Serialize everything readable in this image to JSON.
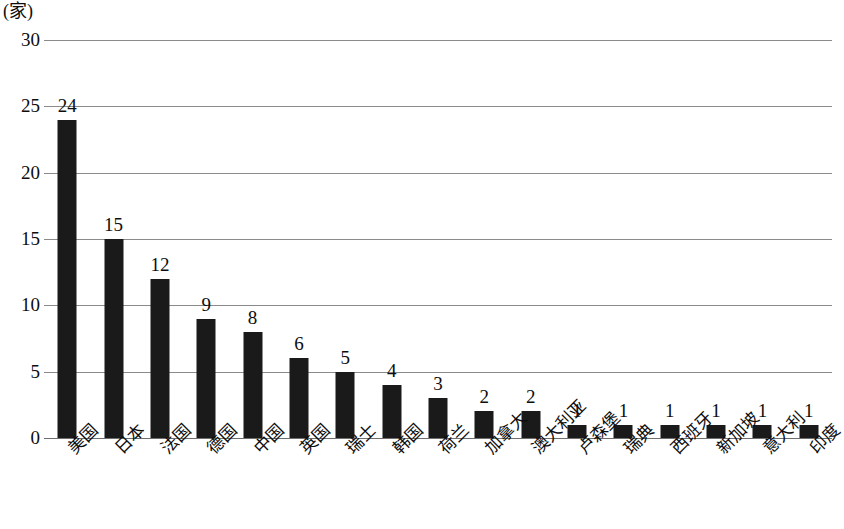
{
  "chart_data": {
    "type": "bar",
    "title": "",
    "subtitle": "",
    "unit_label": "(家)",
    "xlabel": "",
    "ylabel": "",
    "ylim": [
      0,
      30
    ],
    "y_ticks": [
      30,
      25,
      20,
      15,
      10,
      5,
      0
    ],
    "grid": true,
    "legend": "none",
    "bar_color": "#1a1a1a",
    "grid_color": "#8a8a8a",
    "categories": [
      "美国",
      "日本",
      "法国",
      "德国",
      "中国",
      "英国",
      "瑞士",
      "韩国",
      "荷兰",
      "加拿大",
      "澳大利亚",
      "卢森堡",
      "瑞典",
      "西班牙",
      "新加坡",
      "意大利",
      "印度"
    ],
    "values": [
      24,
      15,
      12,
      9,
      8,
      6,
      5,
      4,
      3,
      2,
      2,
      1,
      1,
      1,
      1,
      1,
      1
    ],
    "data_labels": [
      "24",
      "15",
      "12",
      "9",
      "8",
      "6",
      "5",
      "4",
      "3",
      "2",
      "2",
      "1",
      "1",
      "1",
      "1",
      "1",
      "1"
    ]
  }
}
